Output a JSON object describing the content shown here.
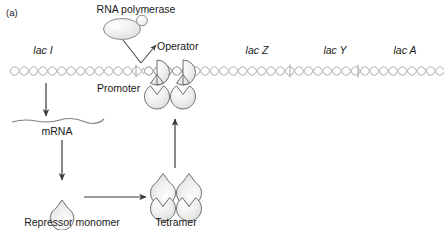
{
  "figure": {
    "panel_label": "(a)",
    "type": "lac-operon-repression-diagram",
    "colors": {
      "dna": "#b9b9bf",
      "protein_fill": "#eeeeee",
      "protein_stroke": "#6e6e6e",
      "arrow": "#3a3a3a",
      "text": "#1a1a1a",
      "background": "#ffffff"
    }
  },
  "labels": {
    "rna_polymerase": "RNA polymerase",
    "operator": "Operator",
    "promoter": "Promoter",
    "lac_i": "lac I",
    "lac_z": "lac Z",
    "lac_y": "lac Y",
    "lac_a": "lac A",
    "mrna": "mRNA",
    "repressor_monomer": "Repressor monomer",
    "tetramer": "Tetramer"
  },
  "genes": [
    {
      "name": "lac I",
      "x": 43
    },
    {
      "name": "lac Z",
      "x": 257
    },
    {
      "name": "lac Y",
      "x": 335
    },
    {
      "name": "lac A",
      "x": 405
    }
  ],
  "molecules": [
    {
      "name": "RNA polymerase",
      "shape": "oval-with-subunit",
      "x": 122,
      "y": 28
    },
    {
      "name": "Repressor tetramer bound at operator",
      "shape": "four-notched-circles",
      "x": 170,
      "y": 84
    },
    {
      "name": "Repressor monomer",
      "shape": "notched-circle",
      "x": 62,
      "y": 198
    },
    {
      "name": "Free repressor tetramer",
      "shape": "four-notched-circles",
      "x": 175,
      "y": 190
    },
    {
      "name": "mRNA transcript",
      "shape": "wavy-line",
      "x": 55,
      "y": 120
    }
  ],
  "arrows": [
    {
      "name": "lacI-to-mRNA",
      "direction": "down",
      "from": "lac I gene",
      "to": "mRNA"
    },
    {
      "name": "mRNA-to-monomer",
      "direction": "down",
      "from": "mRNA",
      "to": "Repressor monomer"
    },
    {
      "name": "monomer-to-tetramer",
      "direction": "right",
      "from": "Repressor monomer",
      "to": "Tetramer"
    },
    {
      "name": "tetramer-to-operator",
      "direction": "up",
      "from": "Tetramer",
      "to": "Operator"
    },
    {
      "name": "polymerase-to-promoter-operator",
      "direction": "v-pointer",
      "from": "RNA polymerase",
      "to": "Operator"
    }
  ]
}
